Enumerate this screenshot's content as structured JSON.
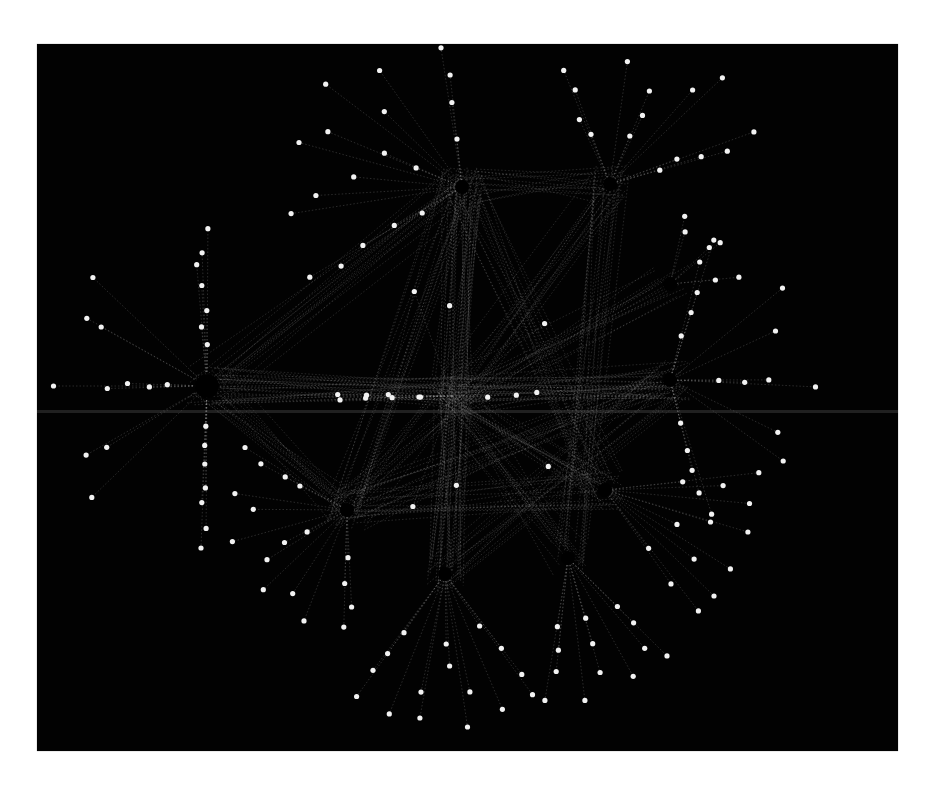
{
  "figure": {
    "kind": "network-graph",
    "caption": "",
    "background_color": "#020202",
    "node_color": "#f2f2f2",
    "edge_color": "#9a9a9a",
    "hub_color": "#000000"
  },
  "graph": {
    "hubs": [
      {
        "id": "hub-left",
        "leaf_count": 140,
        "fan": "left"
      },
      {
        "id": "hub-top",
        "leaf_count": 90,
        "fan": "up-left"
      },
      {
        "id": "hub-top-right",
        "leaf_count": 75,
        "fan": "up-right"
      },
      {
        "id": "hub-right",
        "leaf_count": 80,
        "fan": "right"
      },
      {
        "id": "hub-mid-right",
        "leaf_count": 10,
        "fan": "up-right"
      },
      {
        "id": "hub-bottom-left",
        "leaf_count": 60,
        "fan": "down-left"
      },
      {
        "id": "hub-bottom",
        "leaf_count": 55,
        "fan": "down"
      },
      {
        "id": "hub-bottom-right",
        "leaf_count": 40,
        "fan": "down"
      },
      {
        "id": "hub-right-low",
        "leaf_count": 35,
        "fan": "down-right"
      },
      {
        "id": "hub-center",
        "leaf_count": 60,
        "fan": "all"
      }
    ],
    "hub_links": [
      [
        "hub-left",
        "hub-center"
      ],
      [
        "hub-left",
        "hub-top"
      ],
      [
        "hub-left",
        "hub-right"
      ],
      [
        "hub-left",
        "hub-bottom-left"
      ],
      [
        "hub-top",
        "hub-center"
      ],
      [
        "hub-top",
        "hub-bottom"
      ],
      [
        "hub-top",
        "hub-top-right"
      ],
      [
        "hub-top",
        "hub-bottom-left"
      ],
      [
        "hub-top-right",
        "hub-center"
      ],
      [
        "hub-top-right",
        "hub-bottom-right"
      ],
      [
        "hub-right",
        "hub-center"
      ],
      [
        "hub-right",
        "hub-bottom-left"
      ],
      [
        "hub-bottom",
        "hub-center"
      ],
      [
        "hub-bottom",
        "hub-right"
      ],
      [
        "hub-bottom-right",
        "hub-center"
      ],
      [
        "hub-right-low",
        "hub-center"
      ],
      [
        "hub-right-low",
        "hub-top"
      ],
      [
        "hub-mid-right",
        "hub-center"
      ],
      [
        "hub-bottom-left",
        "hub-center"
      ],
      [
        "hub-bottom-left",
        "hub-right-low"
      ]
    ]
  }
}
